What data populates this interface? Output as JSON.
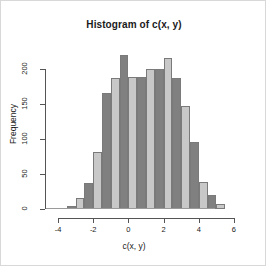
{
  "window": {
    "background_color": "#ffffff",
    "border_color": "#d8d8d8"
  },
  "chart_data": {
    "type": "bar",
    "title": "Histogram of c(x, y)",
    "xlabel": "c(x, y)",
    "ylabel": "Frequency",
    "xlim": [
      -4.4,
      6.4
    ],
    "ylim": [
      0,
      228
    ],
    "grid": false,
    "legend": null,
    "bin_width": 0.5,
    "bin_edges": [
      -3.5,
      -3.0,
      -2.5,
      -2.0,
      -1.5,
      -1.0,
      -0.5,
      0.0,
      0.5,
      1.0,
      1.5,
      2.0,
      2.5,
      3.0,
      3.5,
      4.0,
      4.5,
      5.0,
      5.5
    ],
    "categories": [
      "-3.5",
      "-3.0",
      "-2.5",
      "-2.0",
      "-1.5",
      "-1.0",
      "-0.5",
      "0.0",
      "0.5",
      "1.0",
      "1.5",
      "2.0",
      "2.5",
      "3.0",
      "3.5",
      "4.0",
      "4.5",
      "5.0"
    ],
    "values": [
      4,
      15,
      37,
      81,
      166,
      186,
      220,
      188,
      188,
      199,
      200,
      215,
      187,
      147,
      95,
      39,
      20,
      7
    ],
    "bar_colors": [
      "#808080",
      "#c8c8c8",
      "#808080",
      "#c8c8c8",
      "#808080",
      "#c8c8c8",
      "#808080",
      "#c8c8c8",
      "#808080",
      "#c8c8c8",
      "#808080",
      "#c8c8c8",
      "#808080",
      "#c8c8c8",
      "#808080",
      "#c8c8c8",
      "#808080",
      "#c8c8c8"
    ],
    "bar_border_color": "#7a7a7a",
    "yticks": [
      0,
      50,
      100,
      150,
      200
    ],
    "ytick_labels": [
      "0",
      "50",
      "100",
      "150",
      "200"
    ],
    "xticks": [
      -4,
      -2,
      0,
      2,
      4,
      6
    ],
    "xtick_labels": [
      "-4",
      "-2",
      "0",
      "2",
      "4",
      "6"
    ],
    "axis_color": "#555555"
  }
}
